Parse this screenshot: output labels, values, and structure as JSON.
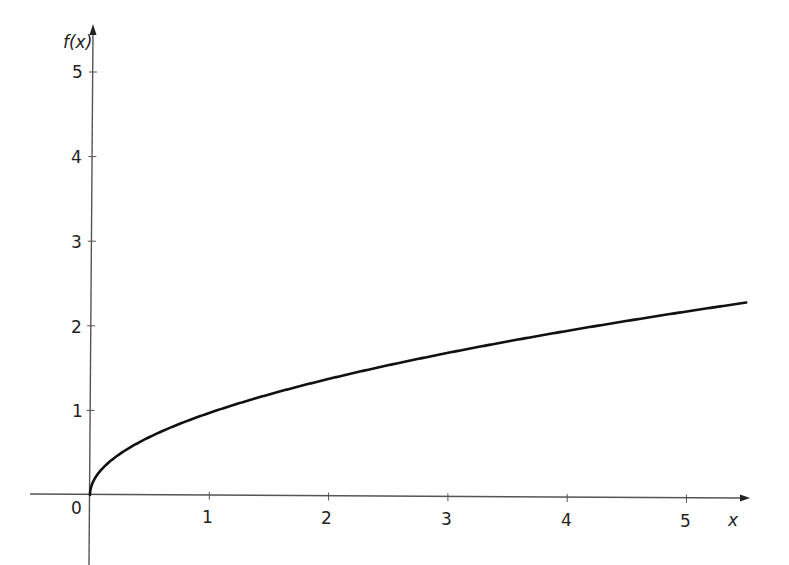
{
  "chart_data": {
    "type": "line",
    "title": "",
    "xlabel": "x",
    "ylabel": "f(x)",
    "function": "f(x) = sqrt(x)",
    "xlim": [
      -0.5,
      5.5
    ],
    "ylim": [
      -0.4,
      5.4
    ],
    "grid": false,
    "legend": null,
    "x_ticks": [
      1,
      2,
      3,
      4,
      5
    ],
    "y_ticks": [
      1,
      2,
      3,
      4,
      5
    ],
    "origin_label": "0",
    "series": [
      {
        "name": "f(x)",
        "x": [
          0,
          0.05,
          0.25,
          0.5,
          1,
          1.5,
          2,
          2.5,
          3,
          3.5,
          4,
          4.5,
          5,
          5.5
        ],
        "values": [
          0,
          0.22,
          0.5,
          0.71,
          1.0,
          1.22,
          1.41,
          1.58,
          1.73,
          1.87,
          2.0,
          2.12,
          2.24,
          2.32
        ]
      }
    ],
    "colors": {
      "curve": "#111111",
      "axes": "#555555",
      "text": "#222222"
    }
  },
  "axes": {
    "x_label": "x",
    "y_label": "f(x)",
    "origin_label": "0",
    "x_tick_labels": [
      "1",
      "2",
      "3",
      "4",
      "5"
    ],
    "y_tick_labels": [
      "1",
      "2",
      "3",
      "4",
      "5"
    ]
  }
}
